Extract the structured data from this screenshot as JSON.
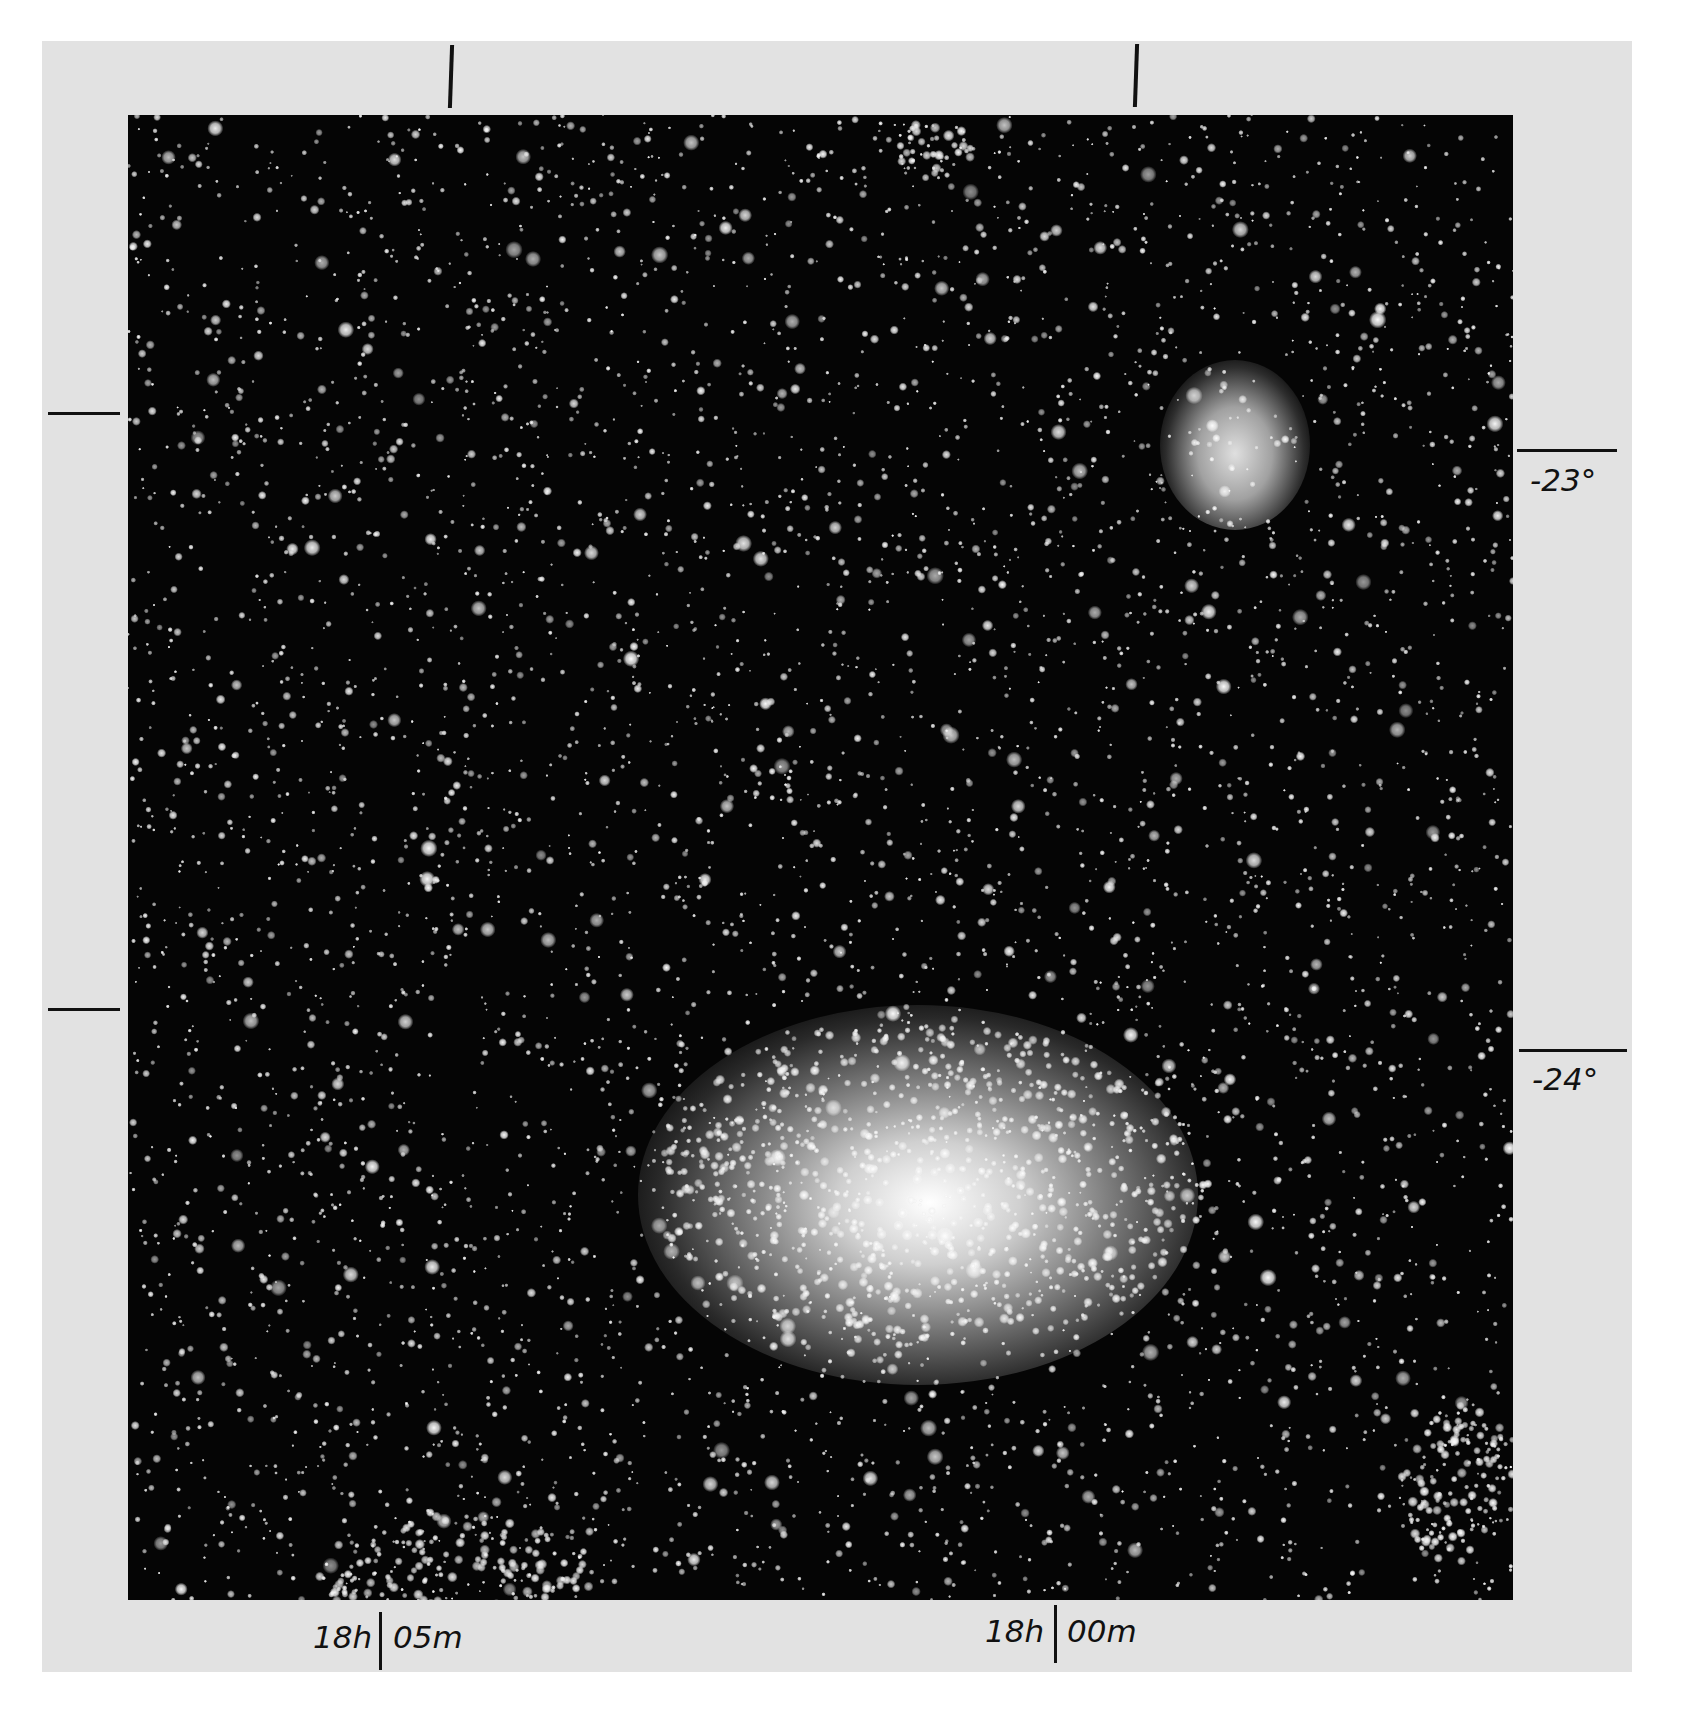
{
  "image": {
    "description": "Photographic star field showing two emission nebulae with celestial coordinate markers",
    "background_color": "#050505",
    "frame_color": "#e2e2e2"
  },
  "coordinates": {
    "declination_labels": [
      {
        "label": "-23°",
        "y": 450
      },
      {
        "label": "-24°",
        "y": 1050
      }
    ],
    "right_ascension_labels": [
      {
        "hours": "18h",
        "minutes": "05m",
        "x": 380
      },
      {
        "hours": "18h",
        "minutes": "00m",
        "x": 1057
      }
    ],
    "top_ticks_x": [
      450,
      1135
    ],
    "left_ticks_y": [
      413,
      1009
    ]
  },
  "objects": [
    {
      "name": "upper-nebula",
      "cx": 1160,
      "cy": 440,
      "rx": 60,
      "ry": 80
    },
    {
      "name": "lower-nebula",
      "cx": 910,
      "cy": 1170,
      "rx": 260,
      "ry": 170
    }
  ]
}
